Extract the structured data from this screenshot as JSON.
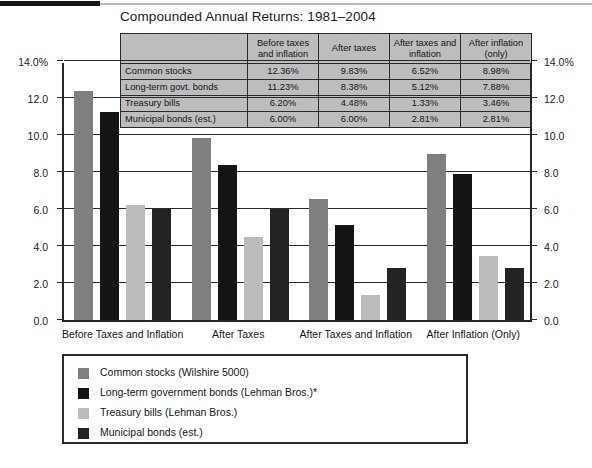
{
  "chart_data": {
    "type": "bar",
    "title": "Compounded Annual Returns: 1981–2004",
    "xlabel": "",
    "ylabel": "",
    "ylim": [
      0,
      14
    ],
    "grid": true,
    "legend_position": "bottom",
    "categories": [
      "Before Taxes and Inflation",
      "After Taxes",
      "After Taxes and Inflation",
      "After Inflation (Only)"
    ],
    "series": [
      {
        "name": "Common stocks (Wilshire 5000)",
        "color": "#7f7f7f",
        "values": [
          12.36,
          9.83,
          6.52,
          8.98
        ]
      },
      {
        "name": "Long-term government bonds (Lehman Bros.)*",
        "color": "#141414",
        "values": [
          11.23,
          8.38,
          5.12,
          7.88
        ]
      },
      {
        "name": "Treasury bills (Lehman Bros.)",
        "color": "#bcbcbc",
        "values": [
          6.2,
          4.48,
          1.33,
          3.46
        ]
      },
      {
        "name": "Municipal bonds (est.)",
        "color": "#232323",
        "values": [
          6.0,
          6.0,
          2.81,
          2.81
        ]
      }
    ],
    "y_ticks": [
      "14.0%",
      "12.0",
      "10.0",
      "8.0",
      "6.0",
      "4.0",
      "2.0",
      "0.0"
    ],
    "y_tick_values": [
      14,
      12,
      10,
      8,
      6,
      4,
      2,
      0
    ]
  },
  "table": {
    "corner_label": "",
    "column_headers": [
      "Before taxes and inflation",
      "After taxes",
      "After taxes and inflation",
      "After inflation (only)"
    ],
    "rows": [
      {
        "label": "Common stocks",
        "values": [
          "12.36%",
          "9.83%",
          "6.52%",
          "8.98%"
        ]
      },
      {
        "label": "Long-term govt. bonds",
        "values": [
          "11.23%",
          "8.38%",
          "5.12%",
          "7.88%"
        ]
      },
      {
        "label": "Treasury bills",
        "values": [
          "6.20%",
          "4.48%",
          "1.33%",
          "3.46%"
        ]
      },
      {
        "label": "Municipal bonds (est.)",
        "values": [
          "6.00%",
          "6.00%",
          "2.81%",
          "2.81%"
        ]
      }
    ]
  },
  "legend": {
    "items": [
      {
        "label": "Common stocks (Wilshire 5000)",
        "color": "#7f7f7f"
      },
      {
        "label": "Long-term government bonds (Lehman Bros.)*",
        "color": "#141414"
      },
      {
        "label": "Treasury bills (Lehman Bros.)",
        "color": "#bcbcbc"
      },
      {
        "label": "Municipal bonds (est.)",
        "color": "#232323"
      }
    ]
  },
  "colors": {
    "axis": "#2a2a2a",
    "table_fill": "#bdbdbd",
    "background": "#ffffff"
  }
}
